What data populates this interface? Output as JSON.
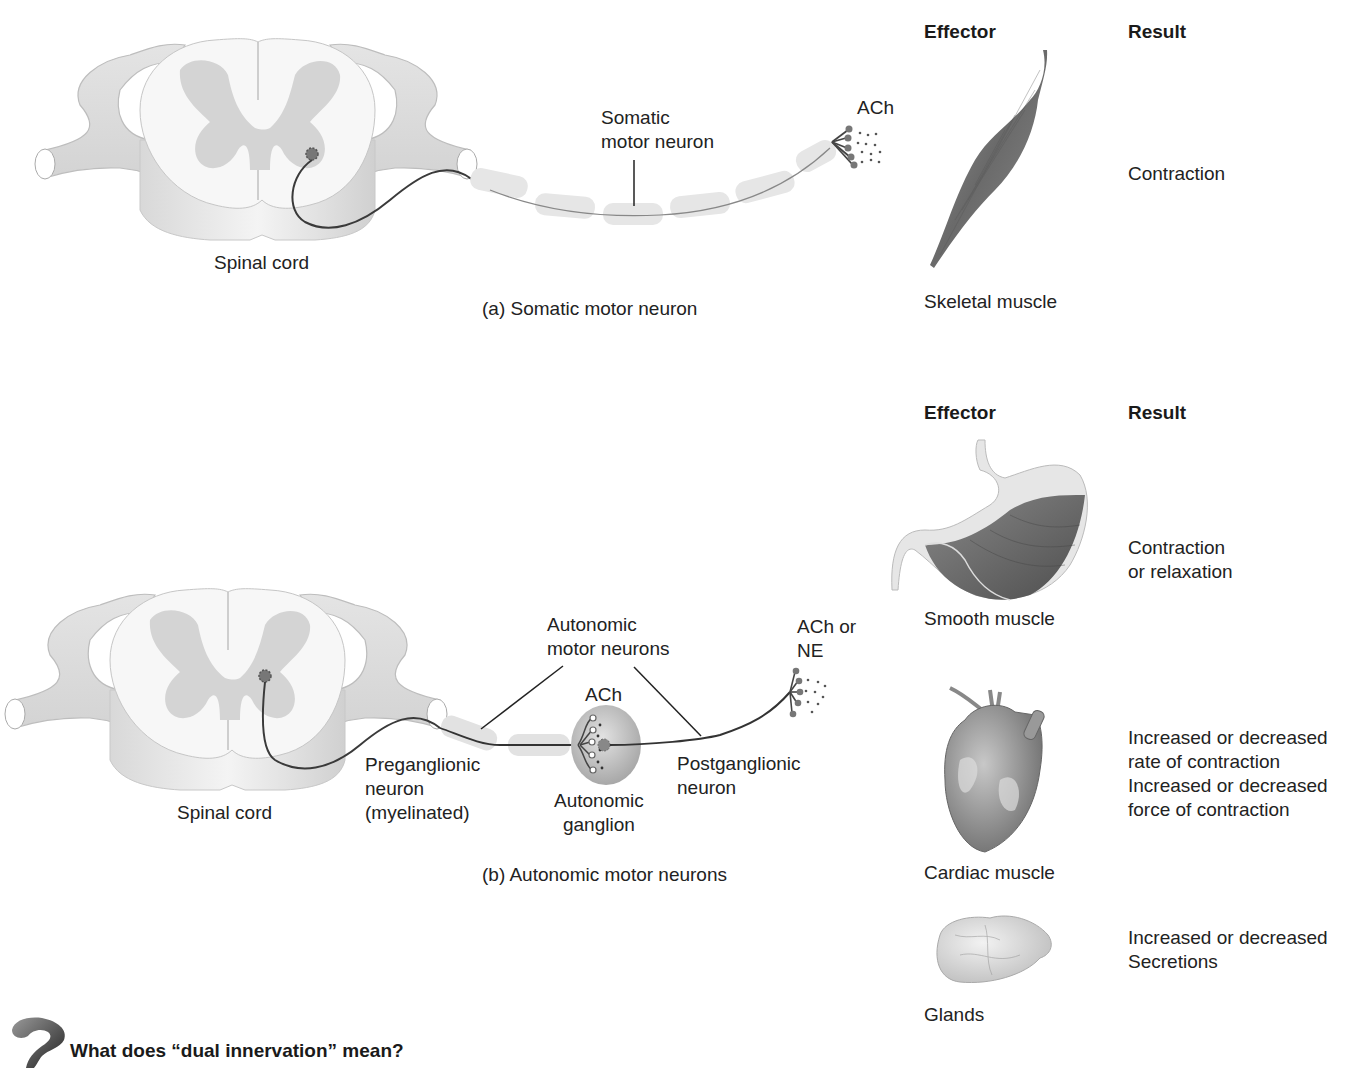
{
  "panel_a": {
    "caption": "(a) Somatic motor neuron",
    "spinal_cord_label": "Spinal cord",
    "neuron_label": [
      "Somatic",
      "motor neuron"
    ],
    "neurotransmitter": "ACh",
    "effector_header": "Effector",
    "result_header": "Result",
    "effector": {
      "name": "Skeletal muscle",
      "icon": "skeletal-muscle-illustration"
    },
    "result": "Contraction"
  },
  "panel_b": {
    "caption": "(b) Autonomic motor neurons",
    "spinal_cord_label": "Spinal cord",
    "neurons_label": [
      "Autonomic",
      "motor neurons"
    ],
    "preganglionic_label": [
      "Preganglionic",
      "neuron",
      "(myelinated)"
    ],
    "ganglion_label": [
      "Autonomic",
      "ganglion"
    ],
    "ganglion_neurotransmitter": "ACh",
    "postganglionic_label": [
      "Postganglionic",
      "neuron"
    ],
    "terminal_neurotransmitter": [
      "ACh or",
      "NE"
    ],
    "effector_header": "Effector",
    "result_header": "Result",
    "effectors": [
      {
        "name": "Smooth muscle",
        "icon": "stomach-illustration",
        "result": [
          "Contraction",
          "or relaxation"
        ]
      },
      {
        "name": "Cardiac muscle",
        "icon": "heart-illustration",
        "result": [
          "Increased or decreased",
          "rate of contraction",
          "Increased or decreased",
          "force of contraction"
        ]
      },
      {
        "name": "Glands",
        "icon": "gland-illustration",
        "result": [
          "Increased or decreased",
          "Secretions"
        ]
      }
    ]
  },
  "question": {
    "icon": "question-mark-icon",
    "text": "What does “dual innervation” mean?"
  }
}
